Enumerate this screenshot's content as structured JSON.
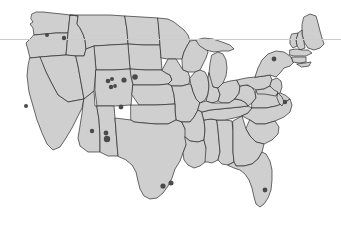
{
  "figure": {
    "name": "contiguous-united-states-map",
    "width": 341,
    "height": 228,
    "background_color": "#ffffff",
    "title": "",
    "caption": ""
  },
  "style": {
    "state_fill": "#cfcfcf",
    "state_stroke": "#2b2b2b",
    "state_stroke_width": 0.7,
    "marker_color": "#4a4a4a",
    "guide_rule_color": "#cccccc",
    "guide_rule_y": 39,
    "guide_rule_width": 1
  },
  "chart_data": {
    "type": "scatter",
    "title": "",
    "xlabel": "",
    "ylabel": "",
    "basemap": "contiguous-united-states",
    "legend": [],
    "grid": false,
    "annotations": [],
    "points": [
      {
        "label": "eastern-washington",
        "x": 47,
        "y": 35,
        "size": 2.0
      },
      {
        "label": "northern-idaho",
        "x": 64,
        "y": 38,
        "size": 2.2
      },
      {
        "label": "san-francisco-bay",
        "x": 26,
        "y": 106,
        "size": 2.0
      },
      {
        "label": "wyoming-west-a",
        "x": 108,
        "y": 81,
        "size": 2.3
      },
      {
        "label": "wyoming-west-b",
        "x": 112,
        "y": 79,
        "size": 2.0
      },
      {
        "label": "wyoming-central-a",
        "x": 111,
        "y": 87,
        "size": 2.2
      },
      {
        "label": "wyoming-central-b",
        "x": 115,
        "y": 86,
        "size": 1.9
      },
      {
        "label": "wyoming-east",
        "x": 124,
        "y": 80,
        "size": 2.6
      },
      {
        "label": "nebraska-panhandle",
        "x": 135,
        "y": 77,
        "size": 2.8
      },
      {
        "label": "colorado-front-range",
        "x": 121,
        "y": 107,
        "size": 2.4
      },
      {
        "label": "arizona-phoenix",
        "x": 92,
        "y": 131,
        "size": 2.2
      },
      {
        "label": "new-mexico-north",
        "x": 106,
        "y": 133,
        "size": 2.4
      },
      {
        "label": "new-mexico-central",
        "x": 107,
        "y": 139,
        "size": 3.2
      },
      {
        "label": "texas-austin",
        "x": 163,
        "y": 186,
        "size": 2.6
      },
      {
        "label": "texas-houston",
        "x": 171,
        "y": 183,
        "size": 2.5
      },
      {
        "label": "new-york-upstate",
        "x": 274,
        "y": 59,
        "size": 2.4
      },
      {
        "label": "virginia-tidewater",
        "x": 285,
        "y": 102,
        "size": 2.2
      },
      {
        "label": "south-florida",
        "x": 265,
        "y": 190,
        "size": 2.4
      }
    ],
    "point_count": 18
  },
  "map_elements": {
    "guide_rule_name": "horizontal-guide-rule",
    "landmass_name": "contiguous-us-landmass",
    "states_group_name": "state-boundaries",
    "markers_group_name": "location-markers"
  }
}
